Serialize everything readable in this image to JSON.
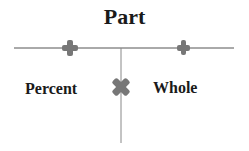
{
  "diagram": {
    "title": "Part",
    "left_label": "Percent",
    "right_label": "Whole",
    "symbols": [
      {
        "name": "plus-icon",
        "position": "top-left"
      },
      {
        "name": "plus-icon",
        "position": "top-right"
      },
      {
        "name": "multiply-icon",
        "position": "center"
      }
    ],
    "colors": {
      "line": "#555555",
      "symbol": "#777777",
      "text": "#1a1a1a"
    }
  }
}
